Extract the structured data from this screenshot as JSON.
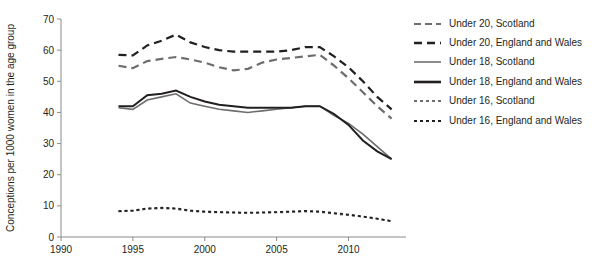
{
  "chart_data": {
    "type": "line",
    "title": "",
    "subtitle": "",
    "xlabel": "",
    "ylabel": "Conceptions per 1000 women in the age group",
    "xlim": [
      1990,
      2014
    ],
    "ylim": [
      0,
      70
    ],
    "xticks": [
      1990,
      1995,
      2000,
      2005,
      2010
    ],
    "xtick_labels": [
      "1990",
      "1995",
      "2000",
      "2005",
      "2010"
    ],
    "yticks": [
      0,
      10,
      20,
      30,
      40,
      50,
      60,
      70
    ],
    "ytick_labels": [
      "0",
      "10",
      "20",
      "30",
      "40",
      "50",
      "60",
      "70"
    ],
    "grid": false,
    "legend_position": "right",
    "x": [
      1994,
      1995,
      1996,
      1997,
      1998,
      1999,
      2000,
      2001,
      2002,
      2003,
      2004,
      2005,
      2006,
      2007,
      2008,
      2009,
      2010,
      2011,
      2012,
      2013
    ],
    "series": [
      {
        "name": "Under 20, Scotland",
        "color": "#6d6d6d",
        "style": "dashed",
        "width": 2.2,
        "values": [
          55.0,
          54.2,
          56.5,
          57.2,
          57.8,
          57.0,
          56.0,
          54.5,
          53.5,
          54.0,
          56.0,
          57.0,
          57.5,
          58.0,
          58.5,
          55.0,
          51.0,
          46.5,
          42.0,
          38.0
        ]
      },
      {
        "name": "Under 20, England and Wales",
        "color": "#231f20",
        "style": "dashed",
        "width": 2.2,
        "values": [
          58.5,
          58.3,
          61.5,
          63.0,
          65.0,
          62.5,
          61.0,
          60.0,
          59.5,
          59.5,
          59.5,
          59.5,
          60.0,
          61.0,
          61.0,
          58.0,
          54.5,
          50.0,
          45.0,
          41.0
        ]
      },
      {
        "name": "Under 18, Scotland",
        "color": "#6d6d6d",
        "style": "solid",
        "width": 1.6,
        "values": [
          41.5,
          41.0,
          44.0,
          45.0,
          46.0,
          43.0,
          42.0,
          41.0,
          40.5,
          40.0,
          40.5,
          41.0,
          41.5,
          42.0,
          42.0,
          39.0,
          36.5,
          33.0,
          29.0,
          25.0
        ]
      },
      {
        "name": "Under 18, England and Wales",
        "color": "#231f20",
        "style": "solid",
        "width": 2.0,
        "values": [
          42.0,
          42.0,
          45.5,
          46.0,
          47.0,
          45.0,
          43.5,
          42.5,
          42.0,
          41.5,
          41.5,
          41.5,
          41.5,
          42.0,
          42.0,
          39.5,
          36.0,
          31.0,
          27.5,
          25.0
        ]
      },
      {
        "name": "Under 16, Scotland",
        "color": "#6d6d6d",
        "style": "dotted",
        "width": 1.8,
        "values": [
          8.2,
          8.4,
          9.0,
          9.2,
          9.0,
          8.3,
          8.0,
          7.9,
          7.8,
          7.7,
          7.8,
          7.9,
          8.0,
          8.2,
          8.0,
          7.5,
          7.0,
          6.5,
          5.8,
          5.0
        ]
      },
      {
        "name": "Under 16, England and Wales",
        "color": "#231f20",
        "style": "dotted",
        "width": 1.8,
        "values": [
          8.3,
          8.5,
          9.2,
          9.4,
          9.2,
          8.5,
          8.2,
          8.0,
          7.9,
          7.8,
          7.9,
          8.0,
          8.2,
          8.4,
          8.2,
          7.7,
          7.2,
          6.6,
          5.9,
          5.1
        ]
      }
    ]
  },
  "legend": {
    "items": [
      {
        "label": "Under 20, Scotland"
      },
      {
        "label": "Under 20, England and Wales"
      },
      {
        "label": "Under 18, Scotland"
      },
      {
        "label": "Under 18, England and Wales"
      },
      {
        "label": "Under 16, Scotland"
      },
      {
        "label": "Under 16, England and Wales"
      }
    ]
  }
}
